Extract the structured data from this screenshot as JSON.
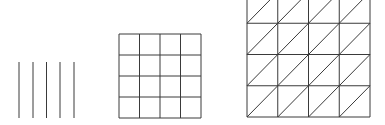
{
  "diagram": {
    "stroke_color": "#3a3a3a",
    "figures": [
      {
        "name": "parallel-lines",
        "line_count": 5,
        "x_positions": [
          19,
          33,
          46.5,
          60,
          74
        ],
        "y_top": 62,
        "y_bottom": 118
      },
      {
        "name": "square-grid",
        "columns": 4,
        "rows": 4,
        "x_left": 119,
        "x_right": 201,
        "y_top": 34,
        "y_bottom": 118
      },
      {
        "name": "triangulated-grid",
        "columns": 4,
        "rows": 4,
        "x_left": 247,
        "x_right": 370,
        "y_top": -8,
        "y_bottom": 117,
        "diagonal_direction": "bottom-left-to-top-right"
      }
    ]
  }
}
